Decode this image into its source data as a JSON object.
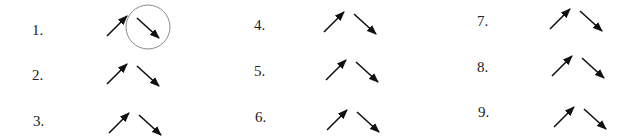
{
  "items": [
    {
      "label": "1.",
      "lx": 32,
      "ly": 23,
      "ax": 107,
      "ay": 36,
      "circled": true
    },
    {
      "label": "2.",
      "lx": 32,
      "ly": 68,
      "ax": 107,
      "ay": 84,
      "circled": false
    },
    {
      "label": "3.",
      "lx": 33,
      "ly": 114,
      "ax": 109,
      "ay": 133,
      "circled": false
    },
    {
      "label": "4.",
      "lx": 254,
      "ly": 18,
      "ax": 324,
      "ay": 32,
      "circled": false
    },
    {
      "label": "5.",
      "lx": 254,
      "ly": 64,
      "ax": 326,
      "ay": 80,
      "circled": false
    },
    {
      "label": "6.",
      "lx": 255,
      "ly": 110,
      "ax": 327,
      "ay": 130,
      "circled": false
    },
    {
      "label": "7.",
      "lx": 477,
      "ly": 14,
      "ax": 550,
      "ay": 29,
      "circled": false
    },
    {
      "label": "8.",
      "lx": 477,
      "ly": 60,
      "ax": 552,
      "ay": 76,
      "circled": false
    },
    {
      "label": "9.",
      "lx": 478,
      "ly": 105,
      "ax": 554,
      "ay": 127,
      "circled": false
    }
  ],
  "colors": {
    "arrow": "#111111",
    "circle": "#888888",
    "text": "#222222"
  }
}
